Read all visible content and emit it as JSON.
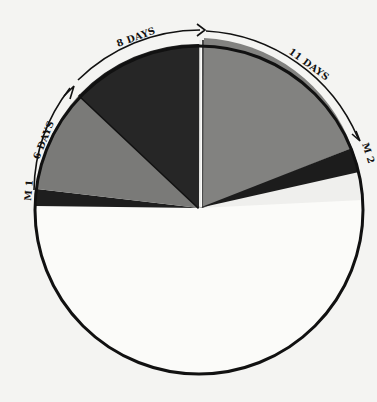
{
  "diagram": {
    "type": "pie-timeline",
    "labels": {
      "m1": "M 1",
      "six_days": "6 DAYS",
      "eight_days": "8 DAYS",
      "eleven_days": "11 DAYS",
      "m2": "M 2"
    },
    "segments": [
      {
        "name": "m1-band",
        "shade": "dark",
        "color": "#1e1e1e"
      },
      {
        "name": "six-days",
        "label": "6 DAYS",
        "shade": "gray",
        "color": "#7a7a78"
      },
      {
        "name": "eight-days",
        "label": "8 DAYS",
        "shade": "dark",
        "color": "#262626"
      },
      {
        "name": "eleven-days",
        "label": "11 DAYS",
        "shade": "gray",
        "color": "#828280"
      },
      {
        "name": "m2-band",
        "shade": "dark",
        "color": "#1c1c1c"
      },
      {
        "name": "remainder",
        "shade": "white",
        "color": "#fafaf8"
      }
    ]
  }
}
